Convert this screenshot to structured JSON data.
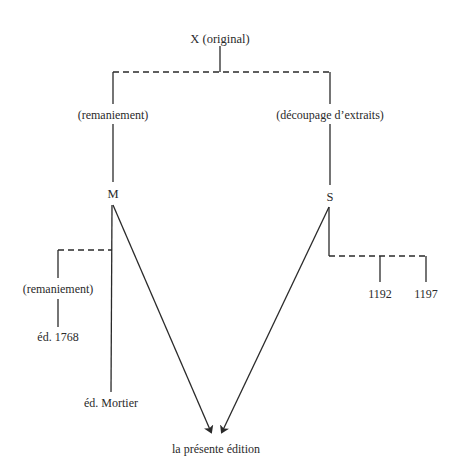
{
  "diagram": {
    "type": "stemma",
    "colors": {
      "line": "#2a2a2a",
      "background": "#ffffff"
    },
    "nodes": {
      "root": "X (original)",
      "left_branch_label": "(remaniement)",
      "right_branch_label": "(découpage d’extraits)",
      "m": "M",
      "s": "S",
      "m_sub_branch_label": "(remaniement)",
      "ed_1768": "éd. 1768",
      "ed_mortier": "éd. Mortier",
      "s_child_1": "1192",
      "s_child_2": "1197",
      "target": "la présente édition"
    },
    "edges": [
      {
        "from": "X (original)",
        "to": "M",
        "style": "dashed+solid",
        "via": "(remaniement)"
      },
      {
        "from": "X (original)",
        "to": "S",
        "style": "dashed+solid",
        "via": "(découpage d’extraits)"
      },
      {
        "from": "M",
        "to": "éd. 1768",
        "style": "dashed+solid",
        "via": "(remaniement)"
      },
      {
        "from": "M",
        "to": "éd. Mortier",
        "style": "solid"
      },
      {
        "from": "M",
        "to": "la présente édition",
        "style": "arrow"
      },
      {
        "from": "S",
        "to": "la présente édition",
        "style": "arrow"
      },
      {
        "from": "S",
        "to": "1192",
        "style": "dashed+solid"
      },
      {
        "from": "S",
        "to": "1197",
        "style": "dashed+solid"
      }
    ]
  }
}
